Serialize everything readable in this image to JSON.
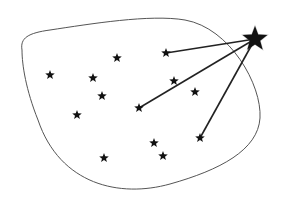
{
  "diagram": {
    "colors": {
      "background": "#ffffff",
      "outline": "#555555",
      "star": "#111111",
      "connector": "#222222"
    },
    "region": {
      "name": "cluster-boundary",
      "path": "M 22 50 C 20 38, 28 33, 50 30 C 90 24, 150 14, 185 20 C 230 28, 262 85, 260 118 C 258 150, 220 170, 170 184 C 120 198, 60 185, 38 120 C 26 90, 22 65, 22 50 Z"
    },
    "external_star": {
      "x": 255,
      "y": 39,
      "size": 13
    },
    "stars": [
      {
        "x": 117,
        "y": 58
      },
      {
        "x": 50,
        "y": 75
      },
      {
        "x": 93,
        "y": 78
      },
      {
        "x": 102,
        "y": 96
      },
      {
        "x": 77,
        "y": 115
      },
      {
        "x": 166,
        "y": 53
      },
      {
        "x": 174,
        "y": 81
      },
      {
        "x": 195,
        "y": 92
      },
      {
        "x": 139,
        "y": 108
      },
      {
        "x": 200,
        "y": 138
      },
      {
        "x": 154,
        "y": 143
      },
      {
        "x": 163,
        "y": 156
      },
      {
        "x": 104,
        "y": 158
      }
    ],
    "connections": [
      {
        "from": "external",
        "to_x": 166,
        "to_y": 53
      },
      {
        "from": "external",
        "to_x": 139,
        "to_y": 108
      },
      {
        "from": "external",
        "to_x": 200,
        "to_y": 138
      }
    ]
  }
}
